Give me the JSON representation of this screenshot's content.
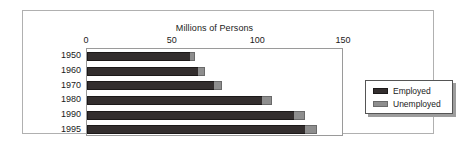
{
  "chart_data": {
    "type": "bar",
    "orientation": "horizontal",
    "stacked": true,
    "title": "Millions of Persons",
    "xlabel": "",
    "ylabel": "",
    "xlim": [
      0,
      150
    ],
    "xticks": [
      0,
      50,
      100,
      150
    ],
    "xtick_labels": [
      "0",
      "50",
      "100",
      "150"
    ],
    "categories": [
      "1950",
      "1960",
      "1970",
      "1980",
      "1990",
      "1995"
    ],
    "grid": false,
    "legend_position": "right",
    "series": [
      {
        "name": "Employed",
        "color": "#332e2e",
        "values": [
          60,
          65,
          74,
          102,
          121,
          127
        ]
      },
      {
        "name": "Unemployed",
        "color": "#8e8e8e",
        "values": [
          3,
          4,
          5,
          6,
          6,
          7
        ]
      }
    ],
    "totals": [
      63,
      69,
      79,
      108,
      127,
      134
    ]
  },
  "legend": {
    "items": [
      {
        "label": "Employed"
      },
      {
        "label": "Unemployed"
      }
    ]
  }
}
